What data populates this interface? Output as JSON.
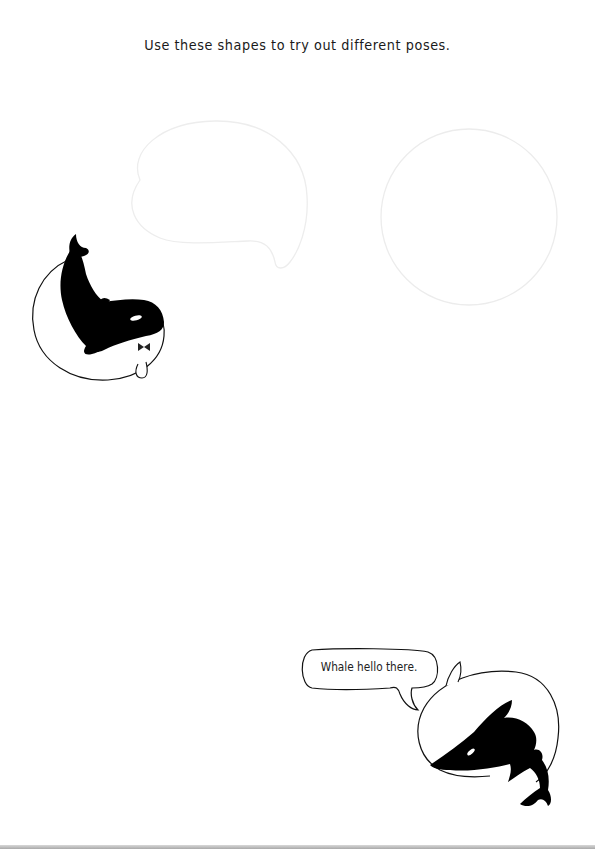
{
  "page": {
    "instruction": "Use these shapes to try out different poses.",
    "speech_bubble": {
      "text": "Whale hello there."
    },
    "templates": [
      {
        "shape": "whale-outline-faint",
        "position": "top-left"
      },
      {
        "shape": "circle-outline-faint",
        "position": "top-right"
      }
    ],
    "illustrations": [
      {
        "name": "curled-orca-with-bowtie",
        "position": "left"
      },
      {
        "name": "orca-in-circle-speaking",
        "position": "bottom-right"
      }
    ],
    "colors": {
      "background": "#ffffff",
      "ink": "#000000",
      "faint_outline": "#ececec",
      "text": "#1a1a1a"
    }
  }
}
